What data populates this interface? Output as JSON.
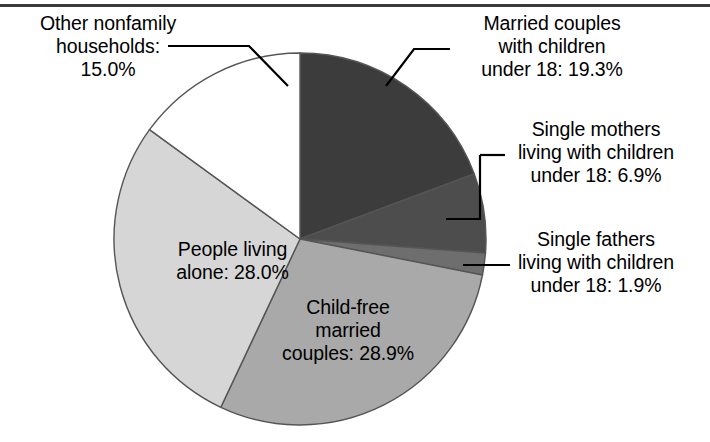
{
  "figure": {
    "background_color": "#ffffff",
    "top_rule_color": "#3a3a3a",
    "outline_color": "#555555"
  },
  "chart_data": {
    "type": "pie",
    "title": "",
    "subtitle": "",
    "xlabel": "",
    "ylabel": "",
    "legend_position": "none",
    "grid": false,
    "units": "percent",
    "start_angle_deg": 0,
    "direction": "clockwise",
    "categories": [
      "Married couples with children under 18",
      "Single mothers living with children under 18",
      "Single fathers living with children under 18",
      "Child-free married couples",
      "People living alone",
      "Other nonfamily households"
    ],
    "values": [
      19.3,
      6.9,
      1.9,
      28.9,
      28.0,
      15.0
    ],
    "colors": [
      "#3c3c3c",
      "#4d4d4d",
      "#6e6e6e",
      "#a9a9a9",
      "#d6d6d6",
      "#ffffff"
    ],
    "slices": [
      {
        "name": "married-couples-with-children",
        "label": "Married couples\nwith children\nunder 18: 19.3%",
        "value": 19.3,
        "color": "#3c3c3c",
        "label_placement": "outside-right"
      },
      {
        "name": "single-mothers",
        "label": "Single mothers\nliving with children\nunder 18: 6.9%",
        "value": 6.9,
        "color": "#4d4d4d",
        "label_placement": "outside-right"
      },
      {
        "name": "single-fathers",
        "label": "Single fathers\nliving with children\nunder 18: 1.9%",
        "value": 1.9,
        "color": "#6e6e6e",
        "label_placement": "outside-right"
      },
      {
        "name": "child-free-married-couples",
        "label": "Child-free\nmarried\ncouples: 28.9%",
        "value": 28.9,
        "color": "#a9a9a9",
        "label_placement": "inside"
      },
      {
        "name": "people-living-alone",
        "label": "People living\nalone: 28.0%",
        "value": 28.0,
        "color": "#d6d6d6",
        "label_placement": "inside"
      },
      {
        "name": "other-nonfamily-households",
        "label": "Other nonfamily\nhouseholds:\n15.0%",
        "value": 15.0,
        "color": "#ffffff",
        "label_placement": "outside-left"
      }
    ]
  },
  "labels": {
    "other_nonfamily": "Other nonfamily\nhouseholds:\n15.0%",
    "married_children": "Married couples\nwith children\nunder 18: 19.3%",
    "single_mothers": "Single mothers\nliving with children\nunder 18: 6.9%",
    "single_fathers": "Single fathers\nliving with children\nunder 18: 1.9%",
    "people_alone": "People living\nalone: 28.0%",
    "child_free": "Child-free\nmarried\ncouples: 28.9%"
  }
}
